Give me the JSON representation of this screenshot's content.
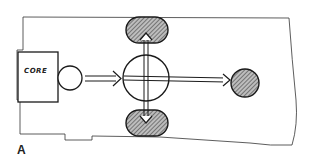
{
  "diagram": {
    "core_label": "CORE",
    "figure_label": "A",
    "nodes": [
      {
        "id": "core",
        "shape": "rectangle",
        "label": "CORE"
      },
      {
        "id": "entry",
        "shape": "circle",
        "fill": "none"
      },
      {
        "id": "hub",
        "shape": "circle",
        "fill": "none",
        "cross": true
      },
      {
        "id": "top",
        "shape": "rounded-blob",
        "fill": "hatched"
      },
      {
        "id": "bottom",
        "shape": "rounded-blob",
        "fill": "hatched"
      },
      {
        "id": "right",
        "shape": "circle",
        "fill": "hatched"
      }
    ],
    "edges": [
      {
        "from": "entry",
        "to": "hub",
        "style": "double-arrow"
      },
      {
        "from": "hub",
        "to": "top",
        "style": "double-arrow"
      },
      {
        "from": "hub",
        "to": "bottom",
        "style": "double-arrow"
      },
      {
        "from": "hub",
        "to": "right",
        "style": "double-arrow"
      }
    ],
    "colors": {
      "stroke": "#1a1a1a",
      "hatch_fill": "#888888",
      "background": "#ffffff"
    }
  }
}
